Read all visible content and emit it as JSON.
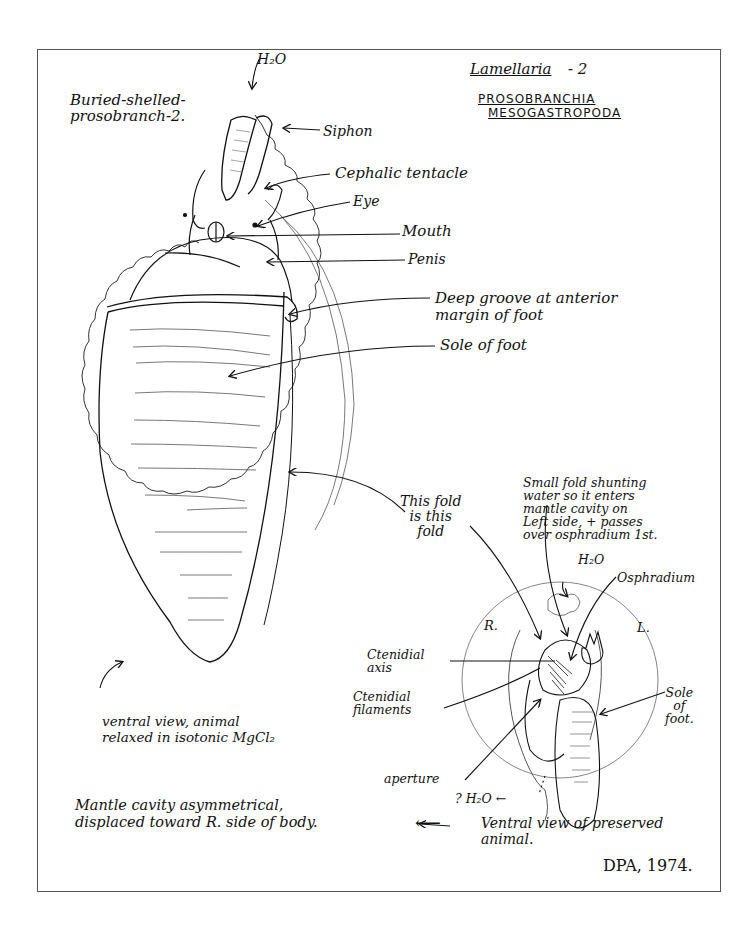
{
  "document": {
    "title": "Buried-shelled-\nprosobranch-2.",
    "genus": "Lamellaria",
    "genus_suffix": "- 2",
    "taxonomy": [
      "PROSOBRANCHIA",
      "MESOGASTROPODA"
    ],
    "signature": "DPA, 1974."
  },
  "main_figure": {
    "labels": {
      "h2o_in": "H₂O",
      "siphon": "Siphon",
      "cephalic_tentacle": "Cephalic tentacle",
      "eye": "Eye",
      "mouth": "Mouth",
      "penis": "Penis",
      "deep_groove": "Deep groove at anterior\nmargin of foot",
      "sole_of_foot": "Sole of foot",
      "this_fold": "This fold\nis this\nfold"
    },
    "caption": "ventral view, animal\nrelaxed in isotonic MgCl₂"
  },
  "inset_figure": {
    "labels": {
      "small_fold_note": "Small fold shunting\nwater so it enters\nmantle cavity on\nLeft side, + passes\nover osphradium 1st.",
      "h2o_in": "H₂O",
      "osphradium": "Osphradium",
      "right": "R.",
      "left": "L.",
      "ctenidial_axis": "Ctenidial\naxis",
      "ctenidial_filaments": "Ctenidial\nfilaments",
      "sole_of_foot": "Sole\nof\nfoot.",
      "aperture": "aperture",
      "h2o_out": "? H₂O ←"
    },
    "caption": "Ventral view of preserved\nanimal."
  },
  "notes": {
    "mantle_cavity": "Mantle cavity asymmetrical,\ndisplaced toward R. side of body.",
    "arrow": "⟵"
  }
}
